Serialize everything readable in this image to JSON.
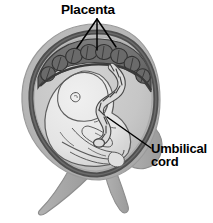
{
  "figure": {
    "type": "anatomical-diagram",
    "background_color": "#ffffff"
  },
  "labels": {
    "placenta": {
      "text": "Placenta",
      "color": "#000000",
      "leader_lines": 3
    },
    "umbilical_cord": {
      "line1": "Umbilical",
      "line2": "cord",
      "color": "#000000",
      "leader_lines": 1
    }
  },
  "structures": {
    "uterine_wall": {
      "name": "uterine-wall",
      "color": "#b5b5b5"
    },
    "myometrium_ring": {
      "name": "myometrium-ring",
      "color": "#5a5a5a"
    },
    "amniotic_cavity": {
      "name": "amniotic-cavity",
      "color": "#c9c9c9"
    },
    "placenta_body": {
      "name": "placenta-body",
      "color": "#6e6e6e"
    },
    "fetus": {
      "name": "fetus",
      "color": "#e9e9e9"
    },
    "umbilical_cord_body": {
      "name": "umbilical-cord-body",
      "color": "#dcdcdc"
    },
    "cervix_limbs": {
      "name": "cervix-and-vaginal-canal",
      "color": "#a8a8a8"
    }
  },
  "colors": {
    "outline": "#3b3b3b",
    "sketch_line": "#555555",
    "leader_line": "#000000"
  }
}
